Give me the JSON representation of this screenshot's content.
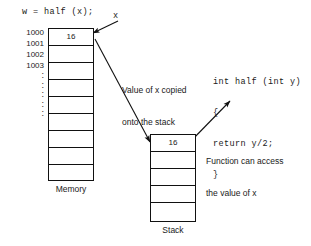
{
  "diagram": {
    "call_expression": "w = half (x);",
    "pointer_label": "x",
    "memory": {
      "title": "Memory",
      "addresses": [
        "1000",
        "1001",
        "1002",
        "1003"
      ],
      "ellipsis_marks": [
        ":",
        ":",
        ":",
        ":",
        ":"
      ],
      "cells": [
        "16",
        "",
        "",
        "",
        "",
        "",
        "",
        "",
        ""
      ]
    },
    "stack": {
      "title": "Stack",
      "cells": [
        "16",
        "",
        "",
        "",
        ""
      ]
    },
    "notes": {
      "copy_note_line1": "Value of x copied",
      "copy_note_line2": "onto the stack",
      "access_note_line1": "Function can access",
      "access_note_line2": "the value of x"
    },
    "code": {
      "line1": "int half (int y)",
      "line2": "{",
      "line3": "return y/2;",
      "line4": "}"
    },
    "colors": {
      "ink": "#111111",
      "background": "#ffffff"
    }
  }
}
